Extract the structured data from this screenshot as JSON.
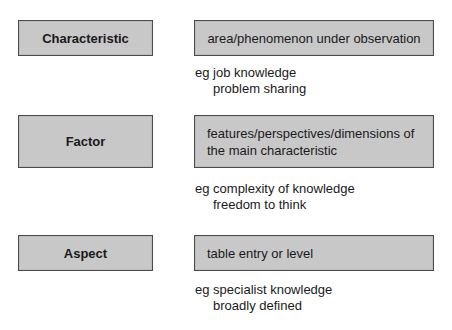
{
  "rows": [
    {
      "term": "Characteristic",
      "definition": "area/phenomenon under observation",
      "example_prefix": "eg job knowledge",
      "example_second": "problem sharing"
    },
    {
      "term": "Factor",
      "definition_line1": "features/perspectives/dimensions of",
      "definition_line2": "the main characteristic",
      "example_prefix": "eg complexity of knowledge",
      "example_second": "freedom to think"
    },
    {
      "term": "Aspect",
      "definition": "table entry or level",
      "example_prefix": "eg specialist knowledge",
      "example_second": "broadly defined"
    }
  ],
  "colors": {
    "box_fill": "#c8c8c8",
    "box_border": "#4a4a4a",
    "text": "#1a1a1a"
  }
}
